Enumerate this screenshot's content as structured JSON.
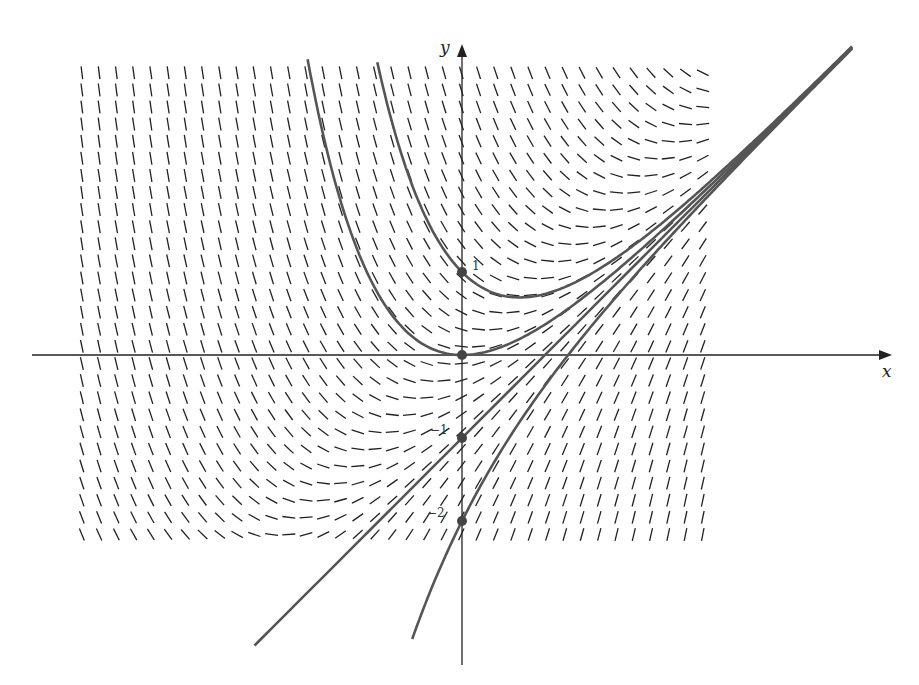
{
  "chart_data": {
    "type": "line",
    "title": "",
    "subtitle": "Direction (slope) field with solution curves",
    "equation": "dy/dx = x - y",
    "xlabel": "x",
    "ylabel": "y",
    "xlim": [
      -5.2,
      5.2
    ],
    "ylim": [
      -3.7,
      3.8
    ],
    "grid": false,
    "legend": null,
    "slope_field": {
      "x_start": -4.58,
      "x_step": 0.2078,
      "x_count": 37,
      "y_start": 3.4,
      "y_step": -0.206,
      "y_count": 28,
      "segment_length": 0.13,
      "color": "#222222"
    },
    "annotations": [
      {
        "text": "1",
        "x": 0,
        "y": 1
      },
      {
        "text": "−1",
        "x": 0,
        "y": -1
      },
      {
        "text": "−2",
        "x": 0,
        "y": -2
      }
    ],
    "points": [
      {
        "x": 0,
        "y": 1
      },
      {
        "x": 0,
        "y": 0
      },
      {
        "x": 0,
        "y": -1
      },
      {
        "x": 0,
        "y": -2
      }
    ],
    "series": [
      {
        "name": "y = x - 1 + 2e^(-x)",
        "C": 2,
        "x_range": [
          -1.02,
          4.7
        ],
        "color": "#555555"
      },
      {
        "name": "y = x - 1 + e^(-x)",
        "C": 1,
        "x_range": [
          -1.86,
          4.7
        ],
        "color": "#555555"
      },
      {
        "name": "y = x - 1",
        "C": 0,
        "x_range": [
          -2.5,
          4.7
        ],
        "color": "#555555"
      },
      {
        "name": "y = x - 1 - e^(-x)",
        "C": -1,
        "x_range": [
          -0.6,
          4.7
        ],
        "color": "#555555"
      }
    ]
  },
  "axes": {
    "x_label": "x",
    "y_label": "y",
    "tick_labels": [
      "1",
      "−1",
      "−2"
    ]
  },
  "colors": {
    "axis": "#222222",
    "curve": "#555555",
    "point": "#444444",
    "field": "#222222"
  }
}
